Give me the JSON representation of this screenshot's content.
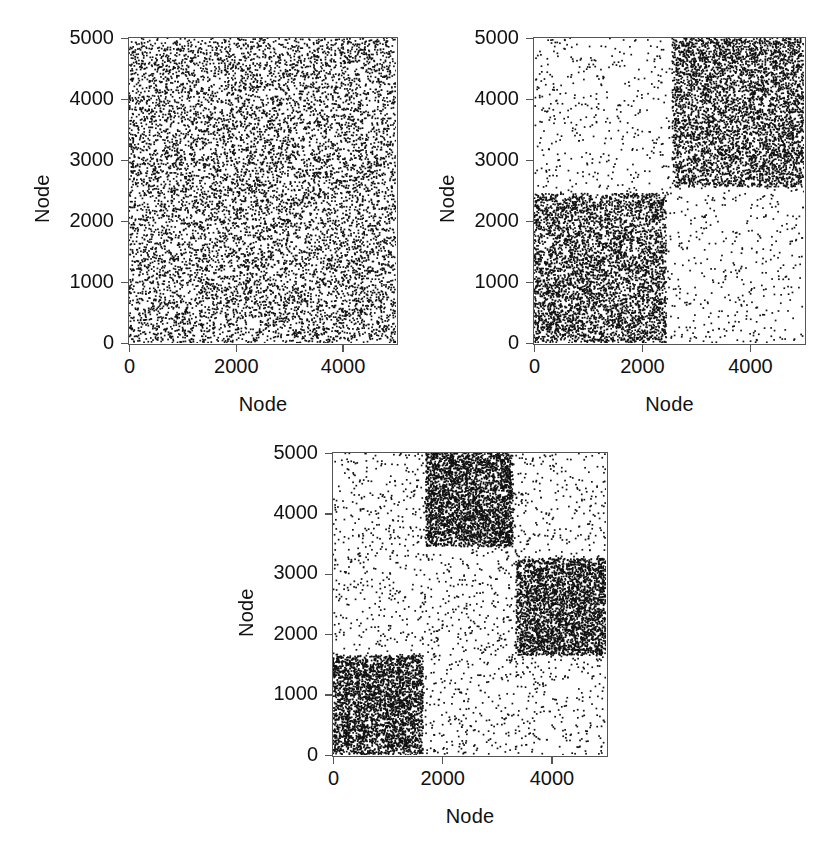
{
  "figure": {
    "background": "#ffffff",
    "point_color": "#111111",
    "frame_color": "#555555"
  },
  "panels": [
    {
      "id": "panel-a",
      "position": {
        "left": 128,
        "top": 37,
        "width": 270,
        "height": 308
      },
      "axes": {
        "x_label": "Node",
        "y_label": "Node",
        "x_ticks": [
          0,
          2000,
          4000
        ],
        "x_tick_labels": [
          "0",
          "2000",
          "4000"
        ],
        "y_ticks": [
          0,
          1000,
          2000,
          3000,
          4000,
          5000
        ],
        "y_tick_labels": [
          "0",
          "1000",
          "2000",
          "3000",
          "4000",
          "5000"
        ],
        "xlim": [
          0,
          5000
        ],
        "ylim": [
          0,
          5000
        ]
      }
    },
    {
      "id": "panel-b",
      "position": {
        "left": 533,
        "top": 37,
        "width": 273,
        "height": 308
      },
      "axes": {
        "x_label": "Node",
        "y_label": "Node",
        "x_ticks": [
          0,
          2000,
          4000
        ],
        "x_tick_labels": [
          "0",
          "2000",
          "4000"
        ],
        "y_ticks": [
          0,
          1000,
          2000,
          3000,
          4000,
          5000
        ],
        "y_tick_labels": [
          "0",
          "1000",
          "2000",
          "3000",
          "4000",
          "5000"
        ],
        "xlim": [
          0,
          5000
        ],
        "ylim": [
          0,
          5000
        ]
      }
    },
    {
      "id": "panel-c",
      "position": {
        "left": 332,
        "top": 452,
        "width": 276,
        "height": 305
      },
      "axes": {
        "x_label": "Node",
        "y_label": "Node",
        "x_ticks": [
          0,
          2000,
          4000
        ],
        "x_tick_labels": [
          "0",
          "2000",
          "4000"
        ],
        "y_ticks": [
          0,
          1000,
          2000,
          3000,
          4000,
          5000
        ],
        "y_tick_labels": [
          "0",
          "1000",
          "2000",
          "3000",
          "4000",
          "5000"
        ],
        "xlim": [
          0,
          5000
        ],
        "ylim": [
          0,
          5000
        ]
      }
    }
  ],
  "chart_data": [
    {
      "type": "scatter",
      "id": "panel-a",
      "title": "",
      "xlabel": "Node",
      "ylabel": "Node",
      "xlim": [
        0,
        5000
      ],
      "ylim": [
        0,
        5000
      ],
      "xticks": [
        0,
        2000,
        4000
      ],
      "yticks": [
        0,
        1000,
        2000,
        3000,
        4000,
        5000
      ],
      "grid": false,
      "legend": "none",
      "description": "Adjacency matrix sparsity pattern of a uniform Erdos-Renyi random graph; edges are spread homogeneously over the whole 5000 x 5000 matrix with no block structure.",
      "marker": "square",
      "marker_size_px": 1.7,
      "n_nodes": 5000,
      "blocks": [
        {
          "x0": 0,
          "x1": 5000,
          "y0": 0,
          "y1": 5000,
          "density": 1.0,
          "points": 9000
        }
      ],
      "background_density": 0.0,
      "background_points": 0,
      "total_points": 9000,
      "seed": 11
    },
    {
      "type": "scatter",
      "id": "panel-b",
      "title": "",
      "xlabel": "Node",
      "ylabel": "Node",
      "xlim": [
        0,
        5000
      ],
      "ylim": [
        0,
        5000
      ],
      "xticks": [
        0,
        2000,
        4000
      ],
      "yticks": [
        0,
        1000,
        2000,
        3000,
        4000,
        5000
      ],
      "grid": false,
      "legend": "none",
      "description": "Adjacency matrix of a two-block stochastic block model with communities on the main diagonal: a dense block spanning nodes 0-2450 and a dense block spanning nodes 2550-5000, with sparse cross-community edges elsewhere.",
      "marker": "square",
      "marker_size_px": 1.7,
      "n_nodes": 5000,
      "blocks": [
        {
          "x0": 0,
          "x1": 2450,
          "y0": 0,
          "y1": 2450,
          "density": 1.0,
          "points": 4200
        },
        {
          "x0": 2560,
          "x1": 5000,
          "y0": 2560,
          "y1": 5000,
          "density": 1.0,
          "points": 4200
        }
      ],
      "background_density": 0.17,
      "background_points": 1450,
      "total_points": 9850,
      "seed": 23
    },
    {
      "type": "scatter",
      "id": "panel-c",
      "title": "",
      "xlabel": "Node",
      "ylabel": "Node",
      "xlim": [
        0,
        5000
      ],
      "ylim": [
        0,
        5000
      ],
      "xticks": [
        0,
        2000,
        4000
      ],
      "yticks": [
        0,
        1000,
        2000,
        3000,
        4000,
        5000
      ],
      "grid": false,
      "legend": "none",
      "description": "Adjacency matrix of a three-block stochastic block model after node relabelling: dense blocks appear off the main diagonal at (0-1650, 0-1650), (3350-5000, 1650-3250) and (1700-3300, 3450-5000), with sparse noise elsewhere.",
      "marker": "square",
      "marker_size_px": 1.7,
      "n_nodes": 5000,
      "blocks": [
        {
          "x0": 0,
          "x1": 1650,
          "y0": 0,
          "y1": 1650,
          "density": 1.0,
          "points": 2900
        },
        {
          "x0": 3350,
          "x1": 5000,
          "y0": 1650,
          "y1": 3250,
          "density": 1.0,
          "points": 2900
        },
        {
          "x0": 1700,
          "x1": 3300,
          "y0": 3450,
          "y1": 5000,
          "density": 1.0,
          "points": 2900
        }
      ],
      "background_density": 0.13,
      "background_points": 2100,
      "total_points": 10800,
      "seed": 37
    }
  ]
}
